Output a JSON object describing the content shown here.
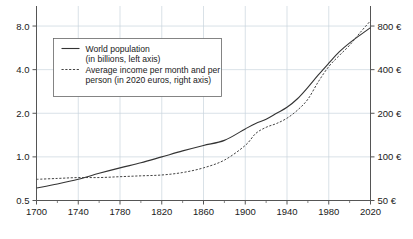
{
  "chart_data": {
    "type": "line",
    "title": "",
    "xlabel": "",
    "ylabel": "",
    "grid": true,
    "legend_position": "upper-left",
    "x_axis": {
      "min": 1700,
      "max": 2020,
      "major_ticks": [
        1700,
        1740,
        1780,
        1820,
        1860,
        1900,
        1940,
        1980,
        2020
      ],
      "minor_tick_step": 20,
      "tick_labels": [
        "1700",
        "1740",
        "1780",
        "1820",
        "1860",
        "1900",
        "1940",
        "1980",
        "2020"
      ]
    },
    "y_axis_left": {
      "scale": "log",
      "min": 0.5,
      "max": 10.0,
      "ticks": [
        0.5,
        1.0,
        2.0,
        4.0,
        8.0
      ],
      "tick_labels": [
        "0.5",
        "1.0",
        "2.0",
        "4.0",
        "8.0"
      ],
      "unit": "billions"
    },
    "y_axis_right": {
      "scale": "log",
      "min": 50,
      "max": 1000,
      "ticks": [
        50,
        100,
        200,
        400,
        800
      ],
      "tick_labels": [
        "50 €",
        "100 €",
        "200 €",
        "400 €",
        "800 €"
      ],
      "unit": "2020 euros per month"
    },
    "legend": [
      {
        "style": "solid",
        "line1": "World population",
        "line2": "(in billions, left axis)"
      },
      {
        "style": "dashed",
        "line1": "Average income per month and per",
        "line2": "person (in 2020 euros, right axis)"
      }
    ],
    "x": [
      1700,
      1720,
      1740,
      1760,
      1780,
      1800,
      1820,
      1840,
      1860,
      1880,
      1900,
      1910,
      1920,
      1930,
      1940,
      1950,
      1960,
      1970,
      1980,
      1990,
      2000,
      2010,
      2020
    ],
    "series": [
      {
        "name": "World population",
        "axis": "left",
        "style": "solid",
        "unit": "billions",
        "values": [
          0.61,
          0.65,
          0.7,
          0.77,
          0.84,
          0.91,
          1.0,
          1.1,
          1.2,
          1.3,
          1.56,
          1.7,
          1.82,
          2.0,
          2.2,
          2.52,
          3.02,
          3.68,
          4.43,
          5.3,
          6.12,
          6.92,
          7.8
        ]
      },
      {
        "name": "Average income per month and per person",
        "axis": "right",
        "style": "dashed",
        "unit": "2020 euros",
        "values": [
          70,
          71,
          72,
          72,
          73,
          74,
          75,
          78,
          84,
          95,
          120,
          145,
          160,
          170,
          185,
          210,
          250,
          330,
          420,
          500,
          590,
          720,
          870
        ]
      }
    ],
    "annotations": []
  }
}
